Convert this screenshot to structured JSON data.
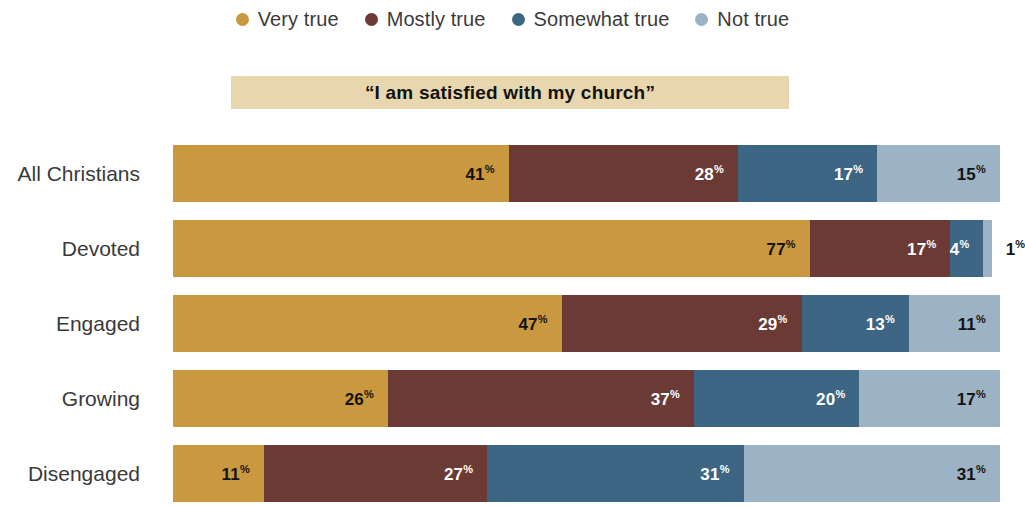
{
  "legend": {
    "items": [
      {
        "label": "Very true",
        "color": "#c9983f",
        "icon": "legend-dot-icon"
      },
      {
        "label": "Mostly true",
        "color": "#6b3a34",
        "icon": "legend-dot-icon"
      },
      {
        "label": "Somewhat true",
        "color": "#3d6684",
        "icon": "legend-dot-icon"
      },
      {
        "label": "Not true",
        "color": "#9bb3c4",
        "icon": "legend-dot-icon"
      }
    ]
  },
  "banner": {
    "title": "“I am satisfied with my church”",
    "background": "#e8d7ae"
  },
  "chart_data": {
    "type": "bar",
    "orientation": "horizontal",
    "stacked": true,
    "stack_total": 100,
    "units": "percent",
    "title": "“I am satisfied with my church”",
    "xlabel": "",
    "ylabel": "",
    "xlim": [
      0,
      100
    ],
    "grid": false,
    "legend_position": "top-center",
    "categories": [
      "All Christians",
      "Devoted",
      "Engaged",
      "Growing",
      "Disengaged"
    ],
    "series": [
      {
        "name": "Very true",
        "color": "#c9983f",
        "values": [
          41,
          77,
          47,
          26,
          11
        ]
      },
      {
        "name": "Mostly true",
        "color": "#6b3a34",
        "values": [
          28,
          17,
          29,
          37,
          27
        ]
      },
      {
        "name": "Somewhat true",
        "color": "#3d6684",
        "values": [
          17,
          4,
          13,
          20,
          31
        ]
      },
      {
        "name": "Not true",
        "color": "#9bb3c4",
        "values": [
          15,
          1,
          11,
          17,
          31
        ]
      }
    ],
    "rows": [
      {
        "label": "All Christians",
        "segments": [
          {
            "series": "Very true",
            "value": 41,
            "label": "41",
            "suffix": "%",
            "color": "#c9983f",
            "text": "dark",
            "label_outside": false
          },
          {
            "series": "Mostly true",
            "value": 28,
            "label": "28",
            "suffix": "%",
            "color": "#6b3a34",
            "text": "light",
            "label_outside": false
          },
          {
            "series": "Somewhat true",
            "value": 17,
            "label": "17",
            "suffix": "%",
            "color": "#3d6684",
            "text": "light",
            "label_outside": false
          },
          {
            "series": "Not true",
            "value": 15,
            "label": "15",
            "suffix": "%",
            "color": "#9bb3c4",
            "text": "dark",
            "label_outside": false
          }
        ]
      },
      {
        "label": "Devoted",
        "segments": [
          {
            "series": "Very true",
            "value": 77,
            "label": "77",
            "suffix": "%",
            "color": "#c9983f",
            "text": "dark",
            "label_outside": false
          },
          {
            "series": "Mostly true",
            "value": 17,
            "label": "17",
            "suffix": "%",
            "color": "#6b3a34",
            "text": "light",
            "label_outside": false
          },
          {
            "series": "Somewhat true",
            "value": 4,
            "label": "4",
            "suffix": "%",
            "color": "#3d6684",
            "text": "light",
            "label_outside": false
          },
          {
            "series": "Not true",
            "value": 1,
            "label": "1",
            "suffix": "%",
            "color": "#9bb3c4",
            "text": "dark",
            "label_outside": true
          }
        ]
      },
      {
        "label": "Engaged",
        "segments": [
          {
            "series": "Very true",
            "value": 47,
            "label": "47",
            "suffix": "%",
            "color": "#c9983f",
            "text": "dark",
            "label_outside": false
          },
          {
            "series": "Mostly true",
            "value": 29,
            "label": "29",
            "suffix": "%",
            "color": "#6b3a34",
            "text": "light",
            "label_outside": false
          },
          {
            "series": "Somewhat true",
            "value": 13,
            "label": "13",
            "suffix": "%",
            "color": "#3d6684",
            "text": "light",
            "label_outside": false
          },
          {
            "series": "Not true",
            "value": 11,
            "label": "11",
            "suffix": "%",
            "color": "#9bb3c4",
            "text": "dark",
            "label_outside": false
          }
        ]
      },
      {
        "label": "Growing",
        "segments": [
          {
            "series": "Very true",
            "value": 26,
            "label": "26",
            "suffix": "%",
            "color": "#c9983f",
            "text": "dark",
            "label_outside": false
          },
          {
            "series": "Mostly true",
            "value": 37,
            "label": "37",
            "suffix": "%",
            "color": "#6b3a34",
            "text": "light",
            "label_outside": false
          },
          {
            "series": "Somewhat true",
            "value": 20,
            "label": "20",
            "suffix": "%",
            "color": "#3d6684",
            "text": "light",
            "label_outside": false
          },
          {
            "series": "Not true",
            "value": 17,
            "label": "17",
            "suffix": "%",
            "color": "#9bb3c4",
            "text": "dark",
            "label_outside": false
          }
        ]
      },
      {
        "label": "Disengaged",
        "segments": [
          {
            "series": "Very true",
            "value": 11,
            "label": "11",
            "suffix": "%",
            "color": "#c9983f",
            "text": "dark",
            "label_outside": false
          },
          {
            "series": "Mostly true",
            "value": 27,
            "label": "27",
            "suffix": "%",
            "color": "#6b3a34",
            "text": "light",
            "label_outside": false
          },
          {
            "series": "Somewhat true",
            "value": 31,
            "label": "31",
            "suffix": "%",
            "color": "#3d6684",
            "text": "light",
            "label_outside": false
          },
          {
            "series": "Not true",
            "value": 31,
            "label": "31",
            "suffix": "%",
            "color": "#9bb3c4",
            "text": "dark",
            "label_outside": false
          }
        ]
      }
    ]
  }
}
